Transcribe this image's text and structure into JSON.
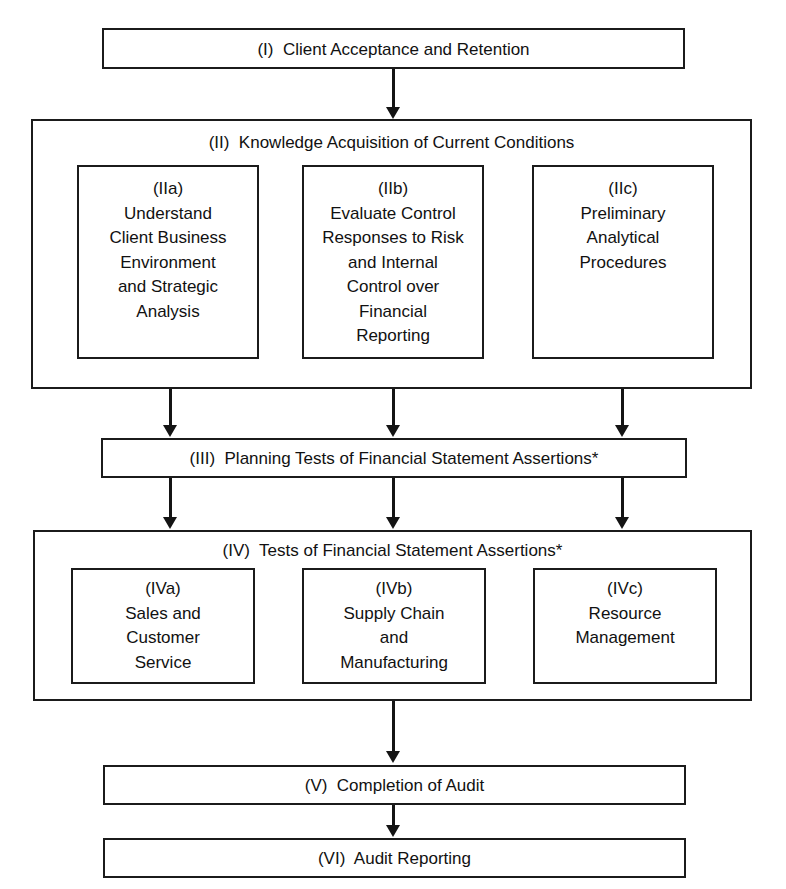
{
  "diagram": {
    "stages": {
      "i": {
        "label": "(I)  Client Acceptance and Retention"
      },
      "ii": {
        "header": "(II)  Knowledge Acquisition of Current Conditions",
        "children": [
          {
            "id": "(IIa)",
            "lines": [
              "Understand",
              "Client Business",
              "Environment",
              "and Strategic",
              "Analysis"
            ]
          },
          {
            "id": "(IIb)",
            "lines": [
              "Evaluate Control",
              "Responses to Risk",
              "and Internal",
              "Control over",
              "Financial",
              "Reporting"
            ]
          },
          {
            "id": "(IIc)",
            "lines": [
              "Preliminary",
              "Analytical",
              "Procedures"
            ]
          }
        ]
      },
      "iii": {
        "label": "(III)  Planning Tests of Financial Statement Assertions*"
      },
      "iv": {
        "header": "(IV)  Tests of Financial Statement Assertions*",
        "children": [
          {
            "id": "(IVa)",
            "lines": [
              "Sales and",
              "Customer",
              "Service"
            ]
          },
          {
            "id": "(IVb)",
            "lines": [
              "Supply Chain",
              "and",
              "Manufacturing"
            ]
          },
          {
            "id": "(IVc)",
            "lines": [
              "Resource",
              "Management"
            ]
          }
        ]
      },
      "v": {
        "label": "(V)  Completion of Audit"
      },
      "vi": {
        "label": "(VI)  Audit Reporting"
      }
    },
    "colors": {
      "stroke": "#1b1b1b",
      "arrow": "#141414",
      "background": "#ffffff",
      "text": "#111111"
    }
  }
}
